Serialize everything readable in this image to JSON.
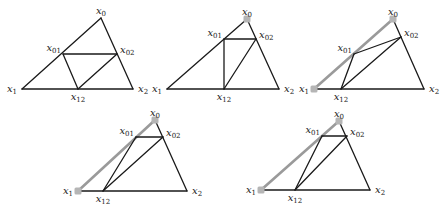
{
  "figure": {
    "colors": {
      "edge": "#1a1a1a",
      "highlight": "#9a9a9a",
      "vertex_marker": "#b5b5b5"
    },
    "labels": {
      "x0": "x",
      "x0_sub": "0",
      "x1": "x",
      "x1_sub": "1",
      "x2": "x",
      "x2_sub": "2",
      "x01": "x",
      "x01_sub": "01",
      "x02": "x",
      "x02_sub": "02",
      "x12": "x",
      "x12_sub": "12"
    },
    "panels": [
      {
        "id": "panel-1",
        "points": {
          "x0": [
            101,
            18
          ],
          "x1": [
            22,
            89
          ],
          "x2": [
            133,
            89
          ],
          "x01": [
            63,
            54
          ],
          "x02": [
            117,
            54
          ],
          "x12": [
            78,
            89
          ]
        },
        "highlight_edges": [],
        "marked_vertices": [],
        "inner_edges": [
          [
            "x01",
            "x02"
          ],
          [
            "x01",
            "x12"
          ],
          [
            "x12",
            "x02"
          ]
        ]
      },
      {
        "id": "panel-2",
        "points": {
          "x0": [
            247,
            19
          ],
          "x1": [
            167,
            89
          ],
          "x2": [
            279,
            89
          ],
          "x01": [
            224,
            39
          ],
          "x02": [
            256,
            39
          ],
          "x12": [
            224,
            89
          ]
        },
        "highlight_edges": [],
        "marked_vertices": [
          "x0"
        ],
        "inner_edges": [
          [
            "x01",
            "x02"
          ],
          [
            "x01",
            "x12"
          ],
          [
            "x12",
            "x02"
          ]
        ]
      },
      {
        "id": "panel-3",
        "points": {
          "x0": [
            393,
            19
          ],
          "x1": [
            314,
            89
          ],
          "x2": [
            424,
            89
          ],
          "x01": [
            354,
            54
          ],
          "x02": [
            401,
            37
          ],
          "x12": [
            341,
            89
          ]
        },
        "highlight_edges": [
          [
            "x1",
            "x0"
          ]
        ],
        "marked_vertices": [
          "x0",
          "x1"
        ],
        "inner_edges": [
          [
            "x01",
            "x02"
          ],
          [
            "x01",
            "x12"
          ],
          [
            "x12",
            "x02"
          ]
        ]
      },
      {
        "id": "panel-4",
        "points": {
          "x0": [
            155,
            120
          ],
          "x1": [
            78,
            191
          ],
          "x2": [
            187,
            191
          ],
          "x01": [
            136,
            137
          ],
          "x02": [
            163,
            137
          ],
          "x12": [
            103,
            191
          ]
        },
        "highlight_edges": [
          [
            "x1",
            "x0"
          ]
        ],
        "marked_vertices": [
          "x0",
          "x1"
        ],
        "inner_edges": [
          [
            "x01",
            "x02"
          ],
          [
            "x01",
            "x12"
          ],
          [
            "x12",
            "x02"
          ]
        ]
      },
      {
        "id": "panel-5",
        "points": {
          "x0": [
            339,
            121
          ],
          "x1": [
            261,
            190
          ],
          "x2": [
            370,
            190
          ],
          "x01": [
            322,
            136
          ],
          "x02": [
            347,
            136
          ],
          "x12": [
            295,
            190
          ]
        },
        "highlight_edges": [
          [
            "x1",
            "x0"
          ]
        ],
        "marked_vertices": [
          "x0",
          "x1"
        ],
        "inner_edges": [
          [
            "x01",
            "x02"
          ],
          [
            "x01",
            "x12"
          ],
          [
            "x12",
            "x02"
          ]
        ]
      }
    ]
  }
}
